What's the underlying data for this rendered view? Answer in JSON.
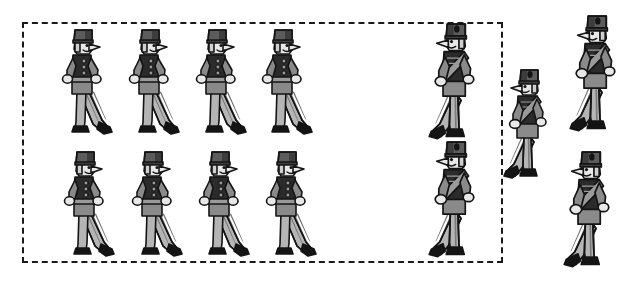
{
  "scene": {
    "title": "Marching toy soldiers illustration",
    "width": 638,
    "height": 282,
    "background_color": "#ffffff",
    "description": "Twelve cartoon toy soldiers; eight inside a dashed rectangle arranged in two rows of four, and four outside or straddling the dashed rectangle on the right side."
  },
  "dashed_box": {
    "name": "selection-boundary",
    "x": 22,
    "y": 22,
    "width": 481,
    "height": 241,
    "stroke_color": "#1a1a1a",
    "stroke_width": 2,
    "dash_pattern": "8 7",
    "fill": "none"
  },
  "palette": {
    "outline": "#141414",
    "hat_dark": "#5c5c5c",
    "hat_shadow": "#3d3d3d",
    "coat_dark": "#2b2b2b",
    "coat_mid": "#8a8a8a",
    "sash": "#9a9a9a",
    "belt": "#9a9a9a",
    "trouser_light": "#b5b5b5",
    "trouser_stripe": "#6e6e6e",
    "skin": "#e8e8e8",
    "boot": "#141414",
    "white": "#ffffff"
  },
  "groups": [
    {
      "id": "inside-group",
      "name": "soldiers-inside-box",
      "facing": "right",
      "count": 8,
      "inside_box": true,
      "style": "plain-coat"
    },
    {
      "id": "outside-group",
      "name": "soldiers-outside-box",
      "facing": "left",
      "count": 4,
      "inside_box": false,
      "style": "sash-coat"
    }
  ],
  "soldiers": [
    {
      "id": "s1",
      "name": "soldier-row1-col1",
      "x": 58,
      "y": 28,
      "scale": 1.0,
      "facing": "right",
      "style": "plain",
      "inside_box": true
    },
    {
      "id": "s2",
      "name": "soldier-row1-col2",
      "x": 125,
      "y": 28,
      "scale": 1.0,
      "facing": "right",
      "style": "plain",
      "inside_box": true
    },
    {
      "id": "s3",
      "name": "soldier-row1-col3",
      "x": 192,
      "y": 28,
      "scale": 1.0,
      "facing": "right",
      "style": "plain",
      "inside_box": true
    },
    {
      "id": "s4",
      "name": "soldier-row1-col4",
      "x": 258,
      "y": 28,
      "scale": 1.0,
      "facing": "right",
      "style": "plain",
      "inside_box": true
    },
    {
      "id": "s5",
      "name": "soldier-row2-col1",
      "x": 60,
      "y": 150,
      "scale": 1.0,
      "facing": "right",
      "style": "plain",
      "inside_box": true
    },
    {
      "id": "s6",
      "name": "soldier-row2-col2",
      "x": 128,
      "y": 150,
      "scale": 1.0,
      "facing": "right",
      "style": "plain",
      "inside_box": true
    },
    {
      "id": "s7",
      "name": "soldier-row2-col3",
      "x": 195,
      "y": 150,
      "scale": 1.0,
      "facing": "right",
      "style": "plain",
      "inside_box": true
    },
    {
      "id": "s8",
      "name": "soldier-row2-col4",
      "x": 262,
      "y": 150,
      "scale": 1.0,
      "facing": "right",
      "style": "plain",
      "inside_box": true
    },
    {
      "id": "s9",
      "name": "soldier-outside-top-left",
      "x": 425,
      "y": 22,
      "scale": 1.06,
      "facing": "left",
      "style": "sash",
      "inside_box": true
    },
    {
      "id": "s10",
      "name": "soldier-outside-middle",
      "x": 500,
      "y": 68,
      "scale": 1.0,
      "facing": "left",
      "style": "sash",
      "inside_box": false
    },
    {
      "id": "s11",
      "name": "soldier-outside-top-right",
      "x": 566,
      "y": 14,
      "scale": 1.06,
      "facing": "left",
      "style": "sash",
      "inside_box": false
    },
    {
      "id": "s12",
      "name": "soldier-outside-bottom-left",
      "x": 425,
      "y": 140,
      "scale": 1.06,
      "facing": "left",
      "style": "sash",
      "inside_box": true
    },
    {
      "id": "s13",
      "name": "soldier-outside-bottom-right",
      "x": 560,
      "y": 150,
      "scale": 1.06,
      "facing": "left",
      "style": "sash",
      "inside_box": false
    }
  ],
  "counts": {
    "total_soldiers": 13,
    "inside_dashed_box": 10,
    "outside_dashed_box": 3,
    "rows_inside": 2,
    "columns_inside": 4
  }
}
